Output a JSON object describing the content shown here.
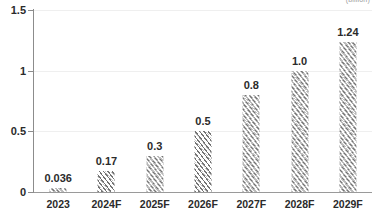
{
  "chart_data": {
    "type": "bar",
    "title": "",
    "subtitle": "",
    "unit_label": "(billion)",
    "xlabel": "",
    "ylabel": "",
    "ylim": [
      0,
      1.5
    ],
    "yticks": [
      "0",
      "0.5",
      "1",
      "1.5"
    ],
    "ytick_values": [
      0,
      0.5,
      1,
      1.5
    ],
    "grid": true,
    "grid_axis": "y",
    "legend": "none",
    "categories": [
      "2023",
      "2024F",
      "2025F",
      "2026F",
      "2027F",
      "2028F",
      "2029F"
    ],
    "values": [
      0.036,
      0.17,
      0.3,
      0.5,
      0.8,
      1.0,
      1.24
    ],
    "value_labels": [
      "0.036",
      "0.17",
      "0.3",
      "0.5",
      "0.8",
      "1.0",
      "1.24"
    ],
    "bar_style": "diagonal-hatch",
    "colors": {
      "bar_hatch": "#696969",
      "axis": "#8c8c8c",
      "gridline": "#efefef",
      "text": "#2b2b2b",
      "caption": "#9a9a9a",
      "background": "#ffffff"
    }
  }
}
